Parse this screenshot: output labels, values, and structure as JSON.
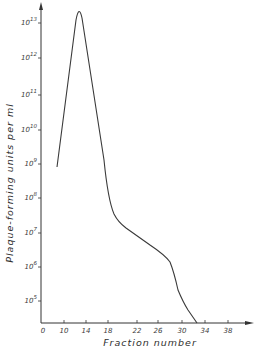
{
  "chart_data": {
    "type": "line",
    "title": "",
    "xlabel": "Fraction number",
    "ylabel": "Plaque-forming units per ml",
    "yscale": "log",
    "grid": false,
    "legend": null,
    "x_ticks": [
      "0",
      "10",
      "14",
      "18",
      "22",
      "26",
      "30",
      "34",
      "38"
    ],
    "y_ticks": [
      "10^5",
      "10^6",
      "10^7",
      "10^8",
      "10^9",
      "10^10",
      "10^11",
      "10^12",
      "10^13"
    ],
    "y_tick_base": "10",
    "y_tick_exponents": [
      "5",
      "6",
      "7",
      "8",
      "9",
      "10",
      "11",
      "12",
      "13"
    ],
    "ylim": [
      10000.0,
      30000000000000.0
    ],
    "series": [
      {
        "name": "PFU",
        "x": [
          7,
          12.5,
          17.5,
          18,
          19,
          22,
          26,
          27,
          28,
          29.5,
          31,
          32.5
        ],
        "y": [
          800000000.0,
          25000000000000.0,
          120000000.0,
          35000000.0,
          18000000.0,
          6000000.0,
          2500000.0,
          1500000.0,
          200000.0,
          40000.0,
          12000.0,
          8000.0
        ]
      }
    ],
    "color": "#3a3a3a"
  }
}
